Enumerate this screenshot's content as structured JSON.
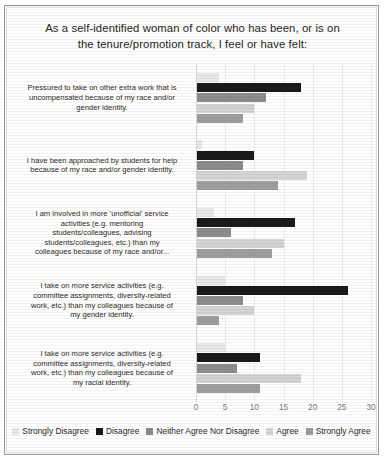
{
  "chart_data": {
    "type": "bar",
    "orientation": "horizontal",
    "title": "As a self-identified woman of color who has been, or is on the tenure/promotion  track, I feel or have felt:",
    "title_lines": [
      "As a self-identified woman of color who has been, or is on",
      "the tenure/promotion  track, I feel or have felt:"
    ],
    "xlabel": "",
    "ylabel": "",
    "xlim": [
      0,
      30
    ],
    "xticks": [
      0,
      5,
      10,
      15,
      20,
      25,
      30
    ],
    "grid": true,
    "legend_position": "bottom",
    "categories": [
      "Pressured to take on other extra work that is uncompensated because of my race and/or gender identity.",
      "I have been approached by students for help because of my race and/or gender identity.",
      "I am involved in more 'unofficial' service activities (e.g. mentoring students/colleagues, advising students/colleagues, etc.) than my colleagues because of my race and/or...",
      "I take on more service activities (e.g. committee assignments, diversity-related work, etc.) than my colleagues because of my gender identity.",
      "I take on more service activities (e.g. committee assignments, diversity-related work, etc.) than my colleagues because of my racial identity."
    ],
    "category_lines": [
      [
        "Pressured to take on other extra work that is",
        "uncompensated because of my race and/or",
        "gender identity."
      ],
      [
        "I have been approached by students for help",
        "because of my race and/or gender identity."
      ],
      [
        "I am involved in more 'unofficial' service",
        "activities (e.g. mentoring",
        "students/colleagues, advising",
        "students/colleagues, etc.) than my",
        "colleagues because of my race and/or..."
      ],
      [
        "I take on more service activities (e.g.",
        "committee assignments, diversity-related",
        "work, etc.) than my colleagues because of",
        "my gender identity."
      ],
      [
        "I take on more service activities (e.g.",
        "committee assignments, diversity-related",
        "work, etc.) than my colleagues because of",
        "my racial identity."
      ]
    ],
    "series": [
      {
        "name": "Strongly Disagree",
        "color": "#e8e8e8",
        "values": [
          4,
          1,
          3,
          5,
          5
        ]
      },
      {
        "name": "Disagree",
        "color": "#1a1a1a",
        "values": [
          18,
          10,
          17,
          26,
          11
        ]
      },
      {
        "name": "Neither Agree Nor Disagree",
        "color": "#8c8c8c",
        "values": [
          12,
          8,
          6,
          8,
          7
        ]
      },
      {
        "name": "Agree",
        "color": "#d4d4d4",
        "values": [
          10,
          19,
          15,
          10,
          18
        ]
      },
      {
        "name": "Strongly Agree",
        "color": "#9e9e9e",
        "values": [
          8,
          14,
          13,
          4,
          11
        ]
      }
    ]
  }
}
